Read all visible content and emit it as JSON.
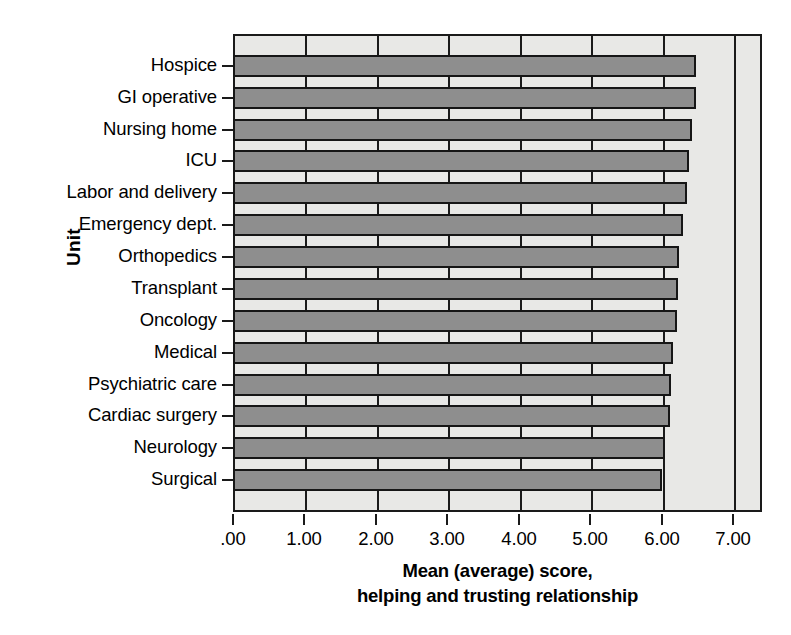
{
  "chart_data": {
    "type": "bar",
    "orientation": "horizontal",
    "title": "",
    "xlabel": "Mean (average) score, helping and trusting relationship",
    "xlabel_lines": [
      "Mean (average) score,",
      "helping and trusting relationship"
    ],
    "ylabel": "Unit",
    "categories": [
      "Hospice",
      "GI operative",
      "Nursing home",
      "ICU",
      "Labor and delivery",
      "Emergency dept.",
      "Orthopedics",
      "Transplant",
      "Oncology",
      "Medical",
      "Psychiatric care",
      "Cardiac surgery",
      "Neurology",
      "Surgical"
    ],
    "values": [
      6.48,
      6.47,
      6.42,
      6.38,
      6.35,
      6.3,
      6.24,
      6.22,
      6.21,
      6.15,
      6.13,
      6.11,
      6.04,
      6.0
    ],
    "xlim": [
      0,
      7.4
    ],
    "xticks": [
      0,
      1,
      2,
      3,
      4,
      5,
      6,
      7
    ],
    "xtick_labels": [
      ".00",
      "1.00",
      "2.00",
      "3.00",
      "4.00",
      "5.00",
      "6.00",
      "7.00"
    ],
    "grid": true,
    "grid_axis": "x",
    "legend": null,
    "bar_color": "#8e8e8e",
    "bar_edge_color": "#161616",
    "plot_background": "#e8e8e6"
  }
}
